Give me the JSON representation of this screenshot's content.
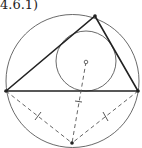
{
  "figure": {
    "label": "4.6.1)",
    "stroke_color": "#222222"
  }
}
